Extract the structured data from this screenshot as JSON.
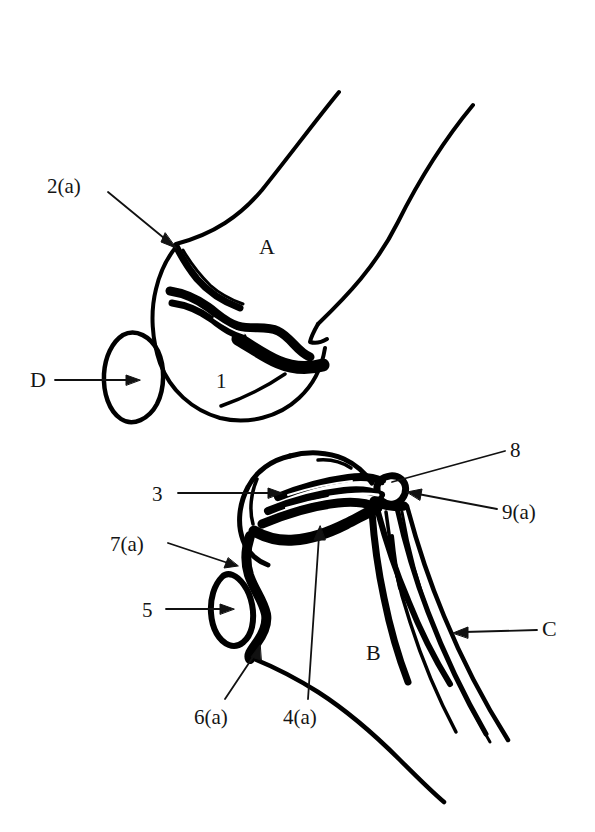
{
  "figure": {
    "type": "anatomical-line-drawing",
    "background_color": "#ffffff",
    "ink_color": "#000000",
    "width": 595,
    "height": 832,
    "panels": [
      {
        "id": "upper",
        "description": "upper limb joint, distal bone end with sesamoid"
      },
      {
        "id": "lower",
        "description": "lower limb joint with two shafts"
      }
    ]
  },
  "labels": {
    "l2a": "2(a)",
    "lA": "A",
    "lD": "D",
    "l1": "1",
    "l3": "3",
    "l8": "8",
    "l9a": "9(a)",
    "l7a": "7(a)",
    "l5": "5",
    "lC": "C",
    "lB": "B",
    "l6a": "6(a)",
    "l4a": "4(a)"
  },
  "leaders": [
    {
      "label": "2(a)",
      "kind": "arrow",
      "from": [
        108,
        192
      ],
      "to": [
        173,
        246
      ]
    },
    {
      "label": "D",
      "kind": "arrow",
      "from": [
        55,
        380
      ],
      "to": [
        133,
        380
      ]
    },
    {
      "label": "3",
      "kind": "arrow",
      "from": [
        178,
        493
      ],
      "to": [
        278,
        493
      ]
    },
    {
      "label": "8",
      "kind": "plain",
      "from": [
        505,
        451
      ],
      "to": [
        390,
        481
      ]
    },
    {
      "label": "9(a)",
      "kind": "arrow",
      "from": [
        497,
        508
      ],
      "to": [
        404,
        495
      ]
    },
    {
      "label": "7(a)",
      "kind": "arrow",
      "from": [
        168,
        543
      ],
      "to": [
        233,
        566
      ]
    },
    {
      "label": "5",
      "kind": "arrow",
      "from": [
        166,
        609
      ],
      "to": [
        230,
        609
      ]
    },
    {
      "label": "C",
      "kind": "arrow",
      "from": [
        537,
        630
      ],
      "to": [
        458,
        632
      ]
    },
    {
      "label": "6(a)",
      "kind": "arrow",
      "from": [
        225,
        700
      ],
      "to": [
        258,
        648
      ]
    },
    {
      "label": "4(a)",
      "kind": "plain",
      "from": [
        308,
        700
      ],
      "to": [
        318,
        530
      ]
    }
  ]
}
